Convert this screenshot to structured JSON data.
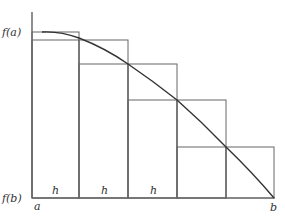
{
  "diagram": {
    "type": "riemann-sum-left-rectangles",
    "labels": {
      "f_a": "f(a)",
      "f_b": "f(b)",
      "a": "a",
      "b": "b",
      "h": [
        "h",
        "h",
        "h"
      ]
    },
    "colors": {
      "line": "#555555",
      "curve": "#333333",
      "background": "#ffffff"
    },
    "subintervals": 5
  }
}
